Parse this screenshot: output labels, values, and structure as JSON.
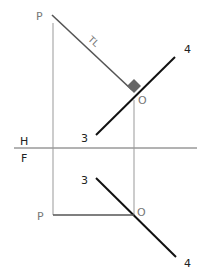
{
  "diagram": {
    "type": "orthographic-projection",
    "labels": {
      "top_point_p": "P",
      "top_point_o": "O",
      "top_line_end_3": "3",
      "top_line_end_4": "4",
      "true_length": "TL",
      "fold_h": "H",
      "fold_f": "F",
      "front_point_p": "P",
      "front_point_o": "O",
      "front_line_end_3": "3",
      "front_line_end_4": "4"
    },
    "colors": {
      "line_dark": "#111111",
      "line_gray": "#555555",
      "projector": "#999999",
      "right_angle_marker": "#666666"
    }
  }
}
